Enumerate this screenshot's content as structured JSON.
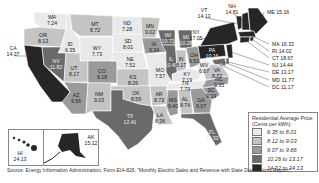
{
  "chart_data": {
    "type": "choropleth",
    "units": "Cents per kWh",
    "legend": {
      "title_line1": "Residential Average Price",
      "title_line2": "(Cents per kWh)",
      "placement": "bottom-right",
      "bins": [
        {
          "label": "6.35 to 8.01",
          "min": 6.35,
          "max": 8.01,
          "color": "#e9e9e9"
        },
        {
          "label": "8.12 to 9.03",
          "min": 8.12,
          "max": 9.03,
          "color": "#c4c4c4"
        },
        {
          "label": "9.07 to 9.66",
          "min": 9.07,
          "max": 9.66,
          "color": "#9a9a9a"
        },
        {
          "label": "10.26 to 13.17",
          "min": 10.26,
          "max": 13.17,
          "color": "#6a6a6a"
        },
        {
          "label": "14.02 to 24.13",
          "min": 14.02,
          "max": 24.13,
          "color": "#262626"
        }
      ]
    },
    "states": [
      {
        "abbr": "WA",
        "value": 7.24
      },
      {
        "abbr": "OR",
        "value": 8.13
      },
      {
        "abbr": "CA",
        "value": 14.37
      },
      {
        "abbr": "ID",
        "value": 6.35
      },
      {
        "abbr": "NV",
        "value": 11.82
      },
      {
        "abbr": "MT",
        "value": 8.72
      },
      {
        "abbr": "WY",
        "value": 7.73
      },
      {
        "abbr": "UT",
        "value": 8.17
      },
      {
        "abbr": "CO",
        "value": 9.18
      },
      {
        "abbr": "AZ",
        "value": 9.56
      },
      {
        "abbr": "NM",
        "value": 9.03
      },
      {
        "abbr": "ND",
        "value": 7.28
      },
      {
        "abbr": "SD",
        "value": 8.01
      },
      {
        "abbr": "NE",
        "value": 7.52
      },
      {
        "abbr": "KS",
        "value": 8.26
      },
      {
        "abbr": "OK",
        "value": 8.59
      },
      {
        "abbr": "TX",
        "value": 12.41
      },
      {
        "abbr": "MN",
        "value": 9.02
      },
      {
        "abbr": "IA",
        "value": 9.34
      },
      {
        "abbr": "MO",
        "value": 7.57
      },
      {
        "abbr": "AR",
        "value": 8.73
      },
      {
        "abbr": "LA",
        "value": 8.36
      },
      {
        "abbr": "WI",
        "value": 10.72
      },
      {
        "abbr": "IL",
        "value": 10.4
      },
      {
        "abbr": "MI",
        "value": 10.26
      },
      {
        "abbr": "IN",
        "value": 8.17
      },
      {
        "abbr": "OH",
        "value": 9.51
      },
      {
        "abbr": "KY",
        "value": 7.19
      },
      {
        "abbr": "TN",
        "value": 7.79
      },
      {
        "abbr": "MS",
        "value": 9.4
      },
      {
        "abbr": "AL",
        "value": 8.74
      },
      {
        "abbr": "GA",
        "value": 9.07
      },
      {
        "abbr": "FL",
        "value": 10.33
      },
      {
        "abbr": "SC",
        "value": 9.19
      },
      {
        "abbr": "NC",
        "value": 9.35
      },
      {
        "abbr": "VA",
        "value": 8.72
      },
      {
        "abbr": "WV",
        "value": 6.67
      },
      {
        "abbr": "PA",
        "value": 10.16
      },
      {
        "abbr": "NY",
        "value": 17.05
      },
      {
        "abbr": "VT",
        "value": 14.13
      },
      {
        "abbr": "NH",
        "value": 14.81
      },
      {
        "abbr": "ME",
        "value": 15.16
      },
      {
        "abbr": "MA",
        "value": 16.33
      },
      {
        "abbr": "RI",
        "value": 14.02
      },
      {
        "abbr": "CT",
        "value": 18.67
      },
      {
        "abbr": "NJ",
        "value": 14.44
      },
      {
        "abbr": "DE",
        "value": 13.17
      },
      {
        "abbr": "MD",
        "value": 11.77
      },
      {
        "abbr": "DC",
        "value": 11.17
      },
      {
        "abbr": "AK",
        "value": 15.12
      },
      {
        "abbr": "HI",
        "value": 24.13
      }
    ]
  },
  "source": "Source: Energy Information Administration, Form EIA-826, \"Monthly Electric Sales and Revenue with State Distributions Report.\""
}
